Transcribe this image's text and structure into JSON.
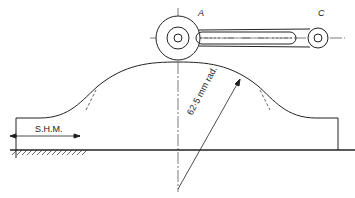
{
  "diagram": {
    "labels": {
      "point_a": "A",
      "point_c": "C",
      "motion": "S.H.M.",
      "radius": "62·5 mm rad."
    },
    "colors": {
      "line": "#222222",
      "background": "#ffffff"
    }
  }
}
